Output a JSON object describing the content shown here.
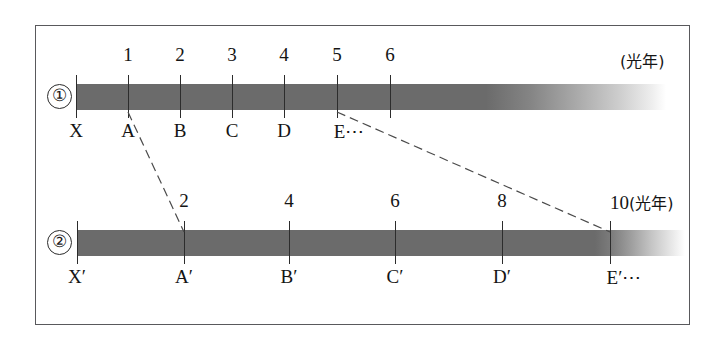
{
  "figure": {
    "kind": "time-dilation-light-year-scale-diagram",
    "unit_label": "(光年)",
    "ellipsis": "⋯"
  },
  "rows": [
    {
      "id": "row1",
      "index_marker": "①",
      "bar": {
        "start_x": 76,
        "solid_end_x": 500,
        "fade_end_x": 666
      },
      "unit_label": "(光年)",
      "unit_label_x": 620,
      "ticks": [
        {
          "x": 76,
          "number": "",
          "letter": "X"
        },
        {
          "x": 128,
          "number": "1",
          "letter": "A"
        },
        {
          "x": 180,
          "number": "2",
          "letter": "B"
        },
        {
          "x": 232,
          "number": "3",
          "letter": "C"
        },
        {
          "x": 284,
          "number": "4",
          "letter": "D"
        },
        {
          "x": 337,
          "number": "5",
          "letter": "E⋯"
        },
        {
          "x": 390,
          "number": "6",
          "letter": ""
        }
      ]
    },
    {
      "id": "row2",
      "index_marker": "②",
      "bar": {
        "start_x": 77,
        "solid_end_x": 612,
        "fade_end_x": 685
      },
      "unit_label": "(光年)",
      "ticks": [
        {
          "x": 77,
          "number": "",
          "letter": "X′"
        },
        {
          "x": 184,
          "number": "2",
          "letter": "A′"
        },
        {
          "x": 289,
          "number": "4",
          "letter": "B′"
        },
        {
          "x": 395,
          "number": "6",
          "letter": "C′"
        },
        {
          "x": 502,
          "number": "8",
          "letter": "D′"
        },
        {
          "x": 610,
          "number": "10",
          "letter": "E′⋯"
        }
      ]
    }
  ],
  "connectors": [
    {
      "name": "connector-a-to-aprime",
      "x1": 128,
      "y1": 112,
      "x2": 184,
      "y2": 232
    },
    {
      "name": "connector-e-to-eprime",
      "x1": 337,
      "y1": 112,
      "x2": 610,
      "y2": 232
    }
  ],
  "colors": {
    "bar": "#6b6b6b",
    "frame": "#59595c",
    "text": "#141414",
    "tick": "#2c2c2c",
    "dash": "#4b4b4b"
  },
  "chart_data": {
    "type": "line",
    "title": "",
    "xlabel": "光年",
    "ylabel": "",
    "grid": false,
    "legend": null,
    "series": [
      {
        "name": "①",
        "tick_values": [
          0,
          1,
          2,
          3,
          4,
          5,
          6
        ],
        "tick_labels": [
          "X",
          "A",
          "B",
          "C",
          "D",
          "E⋯",
          ""
        ],
        "tick_numbers": [
          "",
          "1",
          "2",
          "3",
          "4",
          "5",
          "6"
        ],
        "unit": "光年"
      },
      {
        "name": "②",
        "tick_values": [
          0,
          2,
          4,
          6,
          8,
          10
        ],
        "tick_labels": [
          "X′",
          "A′",
          "B′",
          "C′",
          "D′",
          "E′⋯"
        ],
        "tick_numbers": [
          "",
          "2",
          "4",
          "6",
          "8",
          "10"
        ],
        "unit": "光年"
      }
    ],
    "correspondences": [
      {
        "from": "A (1 光年)",
        "to": "A′ (2 光年)"
      },
      {
        "from": "E (5 光年)",
        "to": "E′ (10 光年)"
      }
    ]
  }
}
